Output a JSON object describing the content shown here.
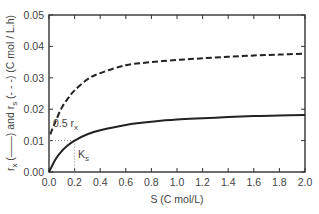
{
  "chart_data": {
    "type": "line",
    "title": "",
    "xlabel": "S (C mol/L)",
    "ylabel_parts": {
      "rx": "r",
      "rx_sub": "x",
      "rx_style": "(——)",
      "and": "and",
      "rs": "r",
      "rs_sub": "s",
      "rs_style": "(- - -)",
      "units": "(C mol / L.h)"
    },
    "xlim": [
      0.0,
      2.0
    ],
    "ylim": [
      0.0,
      0.05
    ],
    "x_ticks": [
      "0.0",
      "0.2",
      "0.4",
      "0.6",
      "0.8",
      "1.0",
      "1.2",
      "1.4",
      "1.6",
      "1.8",
      "2.0"
    ],
    "y_ticks": [
      "0.00",
      "0.01",
      "0.02",
      "0.03",
      "0.04",
      "0.05"
    ],
    "grid": false,
    "legend": "none (encoded in y-axis label)",
    "series": [
      {
        "name": "r_x",
        "style": "solid",
        "x": [
          0.0,
          0.05,
          0.1,
          0.15,
          0.2,
          0.3,
          0.4,
          0.6,
          0.8,
          1.0,
          1.2,
          1.4,
          1.6,
          1.8,
          2.0
        ],
        "values": [
          0.0,
          0.004,
          0.0067,
          0.0086,
          0.01,
          0.012,
          0.0133,
          0.015,
          0.016,
          0.0167,
          0.0171,
          0.0175,
          0.0178,
          0.018,
          0.0182
        ]
      },
      {
        "name": "r_s",
        "style": "dashed",
        "x": [
          0.01,
          0.05,
          0.1,
          0.15,
          0.2,
          0.3,
          0.4,
          0.6,
          0.8,
          1.0,
          1.2,
          1.4,
          1.6,
          1.8,
          2.0
        ],
        "values": [
          0.012,
          0.016,
          0.0205,
          0.0235,
          0.026,
          0.0295,
          0.0315,
          0.034,
          0.035,
          0.0357,
          0.0362,
          0.0367,
          0.0371,
          0.0374,
          0.0377
        ]
      }
    ],
    "annotations": [
      {
        "text": "0.5 r",
        "sub": "x",
        "x": 0.0,
        "y": 0.01,
        "note": "dotted horizontal guide to half of max r_x"
      },
      {
        "text": "K",
        "sub": "s",
        "x": 0.2,
        "y": 0.0,
        "note": "dotted vertical guide at S = Ks"
      }
    ]
  }
}
